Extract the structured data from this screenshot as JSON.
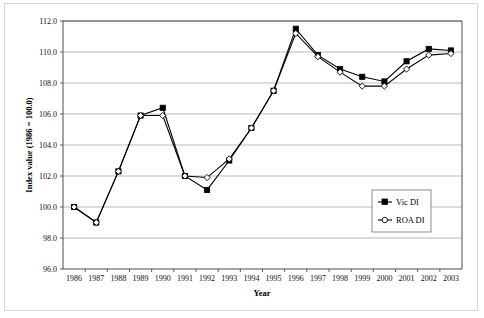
{
  "chart_data": {
    "type": "line",
    "title": "",
    "xlabel": "Year",
    "ylabel": "Index value (1986 = 100.0)",
    "categories": [
      "1986",
      "1987",
      "1988",
      "1989",
      "1990",
      "1991",
      "1992",
      "1993",
      "1994",
      "1995",
      "1996",
      "1997",
      "1998",
      "1999",
      "2000",
      "2001",
      "2002",
      "2003"
    ],
    "ylim": [
      96.0,
      112.0
    ],
    "yticks": [
      "96.0",
      "98.0",
      "100.0",
      "102.0",
      "104.0",
      "106.0",
      "108.0",
      "110.0",
      "112.0"
    ],
    "ytick_values": [
      96.0,
      98.0,
      100.0,
      102.0,
      104.0,
      106.0,
      108.0,
      110.0,
      112.0
    ],
    "grid": true,
    "legend_position": "center-right",
    "series": [
      {
        "name": "Vic DI",
        "marker": "filled-square",
        "values": [
          100.0,
          99.0,
          102.3,
          105.9,
          106.4,
          102.0,
          101.1,
          103.0,
          105.1,
          107.5,
          111.5,
          109.8,
          108.9,
          108.4,
          108.1,
          109.4,
          110.2,
          110.1
        ]
      },
      {
        "name": "ROA DI",
        "marker": "open-diamond",
        "values": [
          100.0,
          99.0,
          102.3,
          105.9,
          105.9,
          102.0,
          101.9,
          103.1,
          105.1,
          107.5,
          111.2,
          109.7,
          108.7,
          107.8,
          107.8,
          108.9,
          109.8,
          109.9
        ]
      }
    ]
  },
  "legend": {
    "entries": [
      {
        "label": "Vic DI"
      },
      {
        "label": "ROA DI"
      }
    ]
  }
}
